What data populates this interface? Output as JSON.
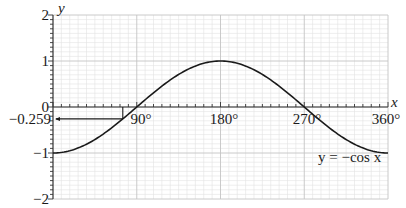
{
  "chart_data": {
    "type": "line",
    "title": "",
    "xlabel": "x",
    "ylabel": "y",
    "xlim": [
      0,
      360
    ],
    "ylim": [
      -2,
      2
    ],
    "grid": true,
    "x_ticks": [
      "90°",
      "180°",
      "270°",
      "360°"
    ],
    "y_ticks": [
      "2",
      "1",
      "0",
      "−1",
      "−2"
    ],
    "series": [
      {
        "name": "y = −cos x",
        "function": "-cos(x)",
        "x": [
          0,
          30,
          60,
          90,
          120,
          150,
          180,
          210,
          240,
          270,
          300,
          330,
          360
        ],
        "values": [
          -1,
          -0.866,
          -0.5,
          0,
          0.5,
          0.866,
          1,
          0.866,
          0.5,
          0,
          -0.5,
          -0.866,
          -1
        ]
      }
    ],
    "annotations": [
      {
        "label": "−0.259",
        "type": "reference-line",
        "y": -0.259,
        "x": 75
      }
    ]
  },
  "labels": {
    "y_axis": "y",
    "x_axis": "x",
    "y2": "2",
    "y1": "1",
    "y0": "0",
    "yneg1": "−1",
    "yneg2": "−2",
    "yref": "−0.259",
    "x90": "90°",
    "x180": "180°",
    "x270": "270°",
    "x360": "360°",
    "curve": "y = −cos x"
  },
  "colors": {
    "grid_minor": "#e2e2e2",
    "grid_major": "#c4c4c4",
    "axis": "#333333",
    "curve": "#1a1a1a"
  }
}
